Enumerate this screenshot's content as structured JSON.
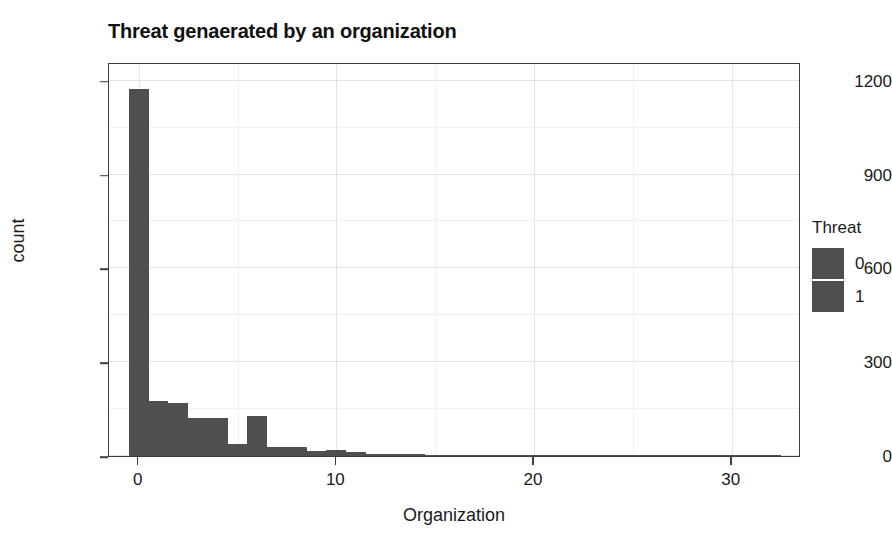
{
  "chart_data": {
    "type": "bar",
    "title": "Threat genaerated by an organization",
    "xlabel": "Organization",
    "ylabel": "count",
    "xlim": [
      -1.5,
      33.5
    ],
    "ylim": [
      0,
      1260
    ],
    "grid": true,
    "legend": {
      "title": "Threat",
      "position": "right",
      "entries": [
        {
          "label": "0",
          "color": "#4f4f4f"
        },
        {
          "label": "1",
          "color": "#4f4f4f"
        }
      ]
    },
    "x_ticks": [
      {
        "value": 0,
        "label": "0"
      },
      {
        "value": 10,
        "label": "10"
      },
      {
        "value": 20,
        "label": "20"
      },
      {
        "value": 30,
        "label": "30"
      }
    ],
    "y_ticks": [
      {
        "value": 0,
        "label": "0"
      },
      {
        "value": 300,
        "label": "300"
      },
      {
        "value": 600,
        "label": "600"
      },
      {
        "value": 900,
        "label": "900"
      },
      {
        "value": 1200,
        "label": "1200"
      }
    ],
    "bin_width": 1,
    "bars": [
      {
        "x": 0,
        "value": 1175
      },
      {
        "x": 1,
        "value": 175
      },
      {
        "x": 2,
        "value": 168
      },
      {
        "x": 3,
        "value": 120
      },
      {
        "x": 4,
        "value": 122
      },
      {
        "x": 5,
        "value": 38
      },
      {
        "x": 6,
        "value": 128
      },
      {
        "x": 7,
        "value": 28
      },
      {
        "x": 8,
        "value": 30
      },
      {
        "x": 9,
        "value": 16
      },
      {
        "x": 10,
        "value": 18
      },
      {
        "x": 11,
        "value": 14
      },
      {
        "x": 12,
        "value": 8
      },
      {
        "x": 13,
        "value": 8
      },
      {
        "x": 14,
        "value": 5
      },
      {
        "x": 15,
        "value": 4
      },
      {
        "x": 16,
        "value": 4
      },
      {
        "x": 17,
        "value": 4
      },
      {
        "x": 18,
        "value": 4
      },
      {
        "x": 19,
        "value": 4
      },
      {
        "x": 20,
        "value": 4
      },
      {
        "x": 21,
        "value": 4
      },
      {
        "x": 22,
        "value": 4
      },
      {
        "x": 23,
        "value": 4
      },
      {
        "x": 24,
        "value": 4
      },
      {
        "x": 25,
        "value": 4
      },
      {
        "x": 26,
        "value": 4
      },
      {
        "x": 27,
        "value": 4
      },
      {
        "x": 28,
        "value": 4
      },
      {
        "x": 29,
        "value": 4
      },
      {
        "x": 30,
        "value": 4
      },
      {
        "x": 31,
        "value": 4
      },
      {
        "x": 32,
        "value": 4
      }
    ],
    "colors": {
      "bar": "#4f4f4f",
      "panel_border": "#3d3d3d",
      "grid_major": "#e3e3e3",
      "grid_minor": "#f0f0f0",
      "background": "#ffffff",
      "text": "#1a1a1a"
    }
  }
}
